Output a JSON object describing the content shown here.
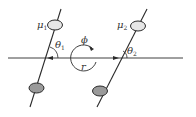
{
  "diagram": {
    "type": "two-dipole interaction geometry",
    "colors": {
      "line": "#2a2a2a",
      "dipole_top_fill": "#e6e6e6",
      "dipole_bottom_fill": "#9a9a9a",
      "text": "#333333"
    },
    "labels": {
      "mu1": "μ",
      "mu1_sub": "1",
      "mu2": "μ",
      "mu2_sub": "2",
      "theta1": "θ",
      "theta1_sub": "1",
      "theta2": "θ",
      "theta2_sub": "2",
      "phi": "ϕ",
      "r": "r"
    },
    "elements": [
      {
        "name": "dipole-1",
        "moment": "μ1",
        "angle": "θ1"
      },
      {
        "name": "dipole-2",
        "moment": "μ2",
        "angle": "θ2"
      },
      {
        "name": "separation-axis",
        "label": "r"
      },
      {
        "name": "rotation-angle",
        "label": "ϕ"
      }
    ]
  }
}
